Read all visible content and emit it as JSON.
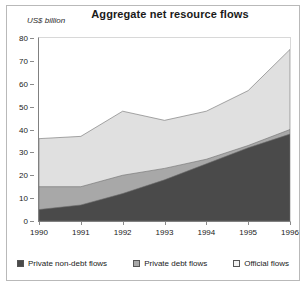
{
  "chart_data": {
    "type": "area",
    "title": "Aggregate net resource flows",
    "subtitle": "",
    "xlabel": "",
    "ylabel": "US$ billion",
    "ylim": [
      0,
      80
    ],
    "yticks": [
      0,
      10,
      20,
      30,
      40,
      50,
      60,
      70,
      80
    ],
    "grid": false,
    "stacked": true,
    "legend_position": "bottom",
    "categories": [
      "1990",
      "1991",
      "1992",
      "1993",
      "1994",
      "1995",
      "1996"
    ],
    "x": [
      1990,
      1991,
      1992,
      1993,
      1994,
      1995,
      1996
    ],
    "series": [
      {
        "name": "Private non-debt flows",
        "color": "#4a4a4a",
        "values": [
          5,
          7,
          12,
          18,
          25,
          32,
          38
        ],
        "cumulative": [
          5,
          7,
          12,
          18,
          25,
          32,
          38
        ]
      },
      {
        "name": "Private debt flows",
        "color": "#a8a8a8",
        "values": [
          10,
          8,
          8,
          5,
          2,
          1,
          2
        ],
        "cumulative": [
          15,
          15,
          20,
          23,
          27,
          33,
          40
        ]
      },
      {
        "name": "Official flows",
        "color": "#e0e0e0",
        "values": [
          21,
          22,
          28,
          21,
          21,
          24,
          35
        ],
        "cumulative": [
          36,
          37,
          48,
          44,
          48,
          57,
          75
        ]
      }
    ]
  },
  "axes": {
    "y_unit_label": "US$ billion",
    "y_tick_labels": [
      "80",
      "70",
      "60",
      "50",
      "40",
      "30",
      "20",
      "10",
      "0"
    ],
    "x_tick_labels": [
      "1990",
      "1991",
      "1992",
      "1993",
      "1994",
      "1995",
      "1996"
    ]
  },
  "legend": {
    "items": [
      {
        "label": "Private non-debt flows",
        "color": "#4a4a4a"
      },
      {
        "label": "Private debt flows",
        "color": "#a8a8a8"
      },
      {
        "label": "Official flows",
        "color": "#f2f2f2"
      }
    ]
  },
  "colors": {
    "private_non_debt": "#4a4a4a",
    "private_debt": "#a8a8a8",
    "official": "#e0e0e0",
    "frame": "#b9b9b9",
    "axis": "#808080",
    "text": "#1a1a1a",
    "background": "#ffffff"
  }
}
